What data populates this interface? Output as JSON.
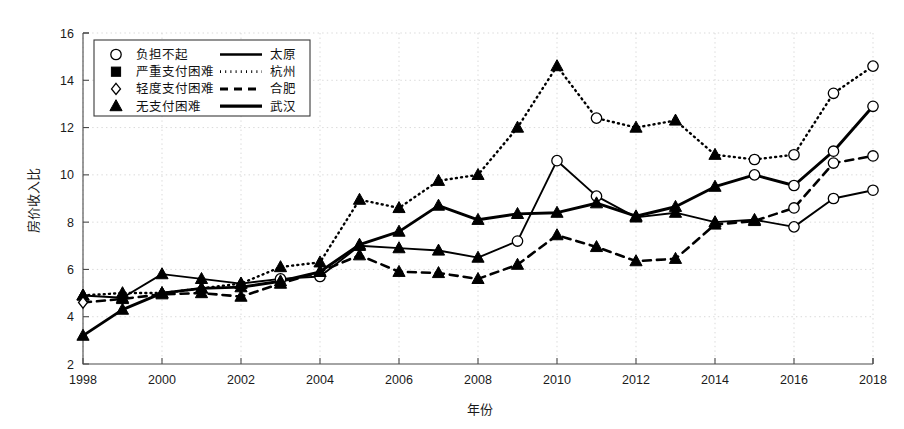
{
  "figure": {
    "background_color": "#ffffff",
    "axis_color": "#4a4a4a",
    "grid_color": "#c8c8c8",
    "ink_color": "#000000"
  },
  "legend": {
    "position": "upper-left-inside",
    "marker_rows": [
      {
        "marker": "circle-open-marker",
        "label": "负担不起"
      },
      {
        "marker": "square-filled-marker",
        "label": "严重支付困难"
      },
      {
        "marker": "diamond-open-marker",
        "label": "轻度支付困难"
      },
      {
        "marker": "triangle-filled-marker",
        "label": "无支付困难"
      }
    ],
    "series_rows": [
      {
        "style": "solid",
        "label": "太原"
      },
      {
        "style": "dotted",
        "label": "杭州"
      },
      {
        "style": "dashed",
        "label": "合肥"
      },
      {
        "style": "thick-solid",
        "label": "武汉"
      }
    ]
  },
  "chart_data": {
    "type": "line",
    "title": "",
    "xlabel": "年份",
    "ylabel": "房价收入比",
    "xlim": [
      1998,
      2018
    ],
    "ylim": [
      2,
      16
    ],
    "xticks": [
      1998,
      2000,
      2002,
      2004,
      2006,
      2008,
      2010,
      2012,
      2014,
      2016,
      2018
    ],
    "yticks": [
      2,
      4,
      6,
      8,
      10,
      12,
      14,
      16
    ],
    "xtick_labels": [
      "1998",
      "2000",
      "2002",
      "2004",
      "2006",
      "2008",
      "2010",
      "2012",
      "2014",
      "2016",
      "2018"
    ],
    "ytick_labels": [
      "2",
      "4",
      "6",
      "8",
      "10",
      "12",
      "14",
      "16"
    ],
    "grid": true,
    "legend_position": "upper left",
    "x": [
      1998,
      1999,
      2000,
      2001,
      2002,
      2003,
      2004,
      2005,
      2006,
      2007,
      2008,
      2009,
      2010,
      2011,
      2012,
      2013,
      2014,
      2015,
      2016,
      2017,
      2018
    ],
    "series": [
      {
        "name": "太原",
        "line_style": "solid",
        "values": [
          4.9,
          4.8,
          5.8,
          5.6,
          5.4,
          5.6,
          5.7,
          7.0,
          6.9,
          6.8,
          6.5,
          7.2,
          10.6,
          9.1,
          8.2,
          8.4,
          8.0,
          8.1,
          7.8,
          9.0,
          9.35
        ],
        "markers": [
          "triangle",
          "triangle",
          "triangle",
          "triangle",
          "triangle",
          "circle",
          "circle",
          "triangle",
          "triangle",
          "triangle",
          "triangle",
          "circle",
          "circle",
          "circle",
          "triangle",
          "triangle",
          "triangle",
          "triangle",
          "circle",
          "circle",
          "circle"
        ]
      },
      {
        "name": "杭州",
        "line_style": "dotted",
        "values": [
          4.9,
          5.0,
          5.0,
          5.2,
          5.4,
          6.1,
          6.3,
          8.95,
          8.6,
          9.75,
          10.0,
          12.0,
          14.6,
          12.4,
          12.0,
          12.3,
          10.85,
          10.65,
          10.85,
          13.45,
          14.6
        ],
        "markers": [
          "triangle",
          "triangle",
          "triangle",
          "triangle",
          "triangle",
          "triangle",
          "triangle",
          "triangle",
          "triangle",
          "triangle",
          "triangle",
          "triangle",
          "triangle",
          "circle",
          "triangle",
          "triangle",
          "triangle",
          "circle",
          "circle",
          "circle",
          "circle"
        ]
      },
      {
        "name": "合肥",
        "line_style": "dashed",
        "values": [
          4.6,
          4.75,
          4.95,
          5.0,
          4.85,
          5.4,
          5.9,
          6.6,
          5.9,
          5.85,
          5.6,
          6.2,
          7.45,
          6.95,
          6.35,
          6.45,
          7.9,
          8.05,
          8.6,
          10.5,
          10.8
        ],
        "markers": [
          "diamond",
          "triangle",
          "triangle",
          "triangle",
          "triangle",
          "triangle",
          "triangle",
          "triangle",
          "triangle",
          "triangle",
          "triangle",
          "triangle",
          "triangle",
          "triangle",
          "triangle",
          "triangle",
          "triangle",
          "triangle",
          "circle",
          "circle",
          "circle"
        ]
      },
      {
        "name": "武汉",
        "line_style": "thick-solid",
        "values": [
          3.2,
          4.3,
          5.0,
          5.2,
          5.25,
          5.5,
          5.9,
          7.05,
          7.6,
          8.7,
          8.1,
          8.35,
          8.4,
          8.8,
          8.25,
          8.65,
          9.5,
          10.0,
          9.55,
          11.0,
          12.9
        ],
        "markers": [
          "triangle",
          "triangle",
          "triangle",
          "triangle",
          "triangle",
          "triangle",
          "triangle",
          "triangle",
          "triangle",
          "triangle",
          "triangle",
          "triangle",
          "triangle",
          "triangle",
          "triangle",
          "triangle",
          "triangle",
          "circle",
          "circle",
          "circle",
          "circle"
        ]
      }
    ]
  }
}
